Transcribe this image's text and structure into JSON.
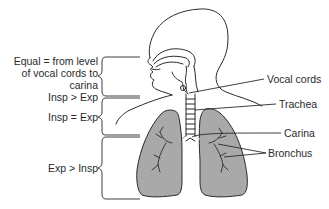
{
  "diagram": {
    "type": "anatomical-airway-diagram",
    "colors": {
      "line": "#2a2a2a",
      "lung_fill": "#a9a9a9",
      "background": "#ffffff"
    },
    "left_labels": [
      {
        "id": "zone-upper",
        "lines": [
          "Equal = from level",
          "of vocal cords to",
          "carina"
        ]
      },
      {
        "id": "zone-upper-sub",
        "lines": [
          "Insp > Exp"
        ]
      },
      {
        "id": "zone-middle",
        "lines": [
          "Insp = Exp"
        ]
      },
      {
        "id": "zone-lower",
        "lines": [
          "Exp > Insp"
        ]
      }
    ],
    "right_labels": [
      {
        "id": "vocal-cords",
        "text": "Vocal cords"
      },
      {
        "id": "trachea",
        "text": "Trachea"
      },
      {
        "id": "carina",
        "text": "Carina"
      },
      {
        "id": "bronchus",
        "text": "Bronchus"
      }
    ]
  }
}
